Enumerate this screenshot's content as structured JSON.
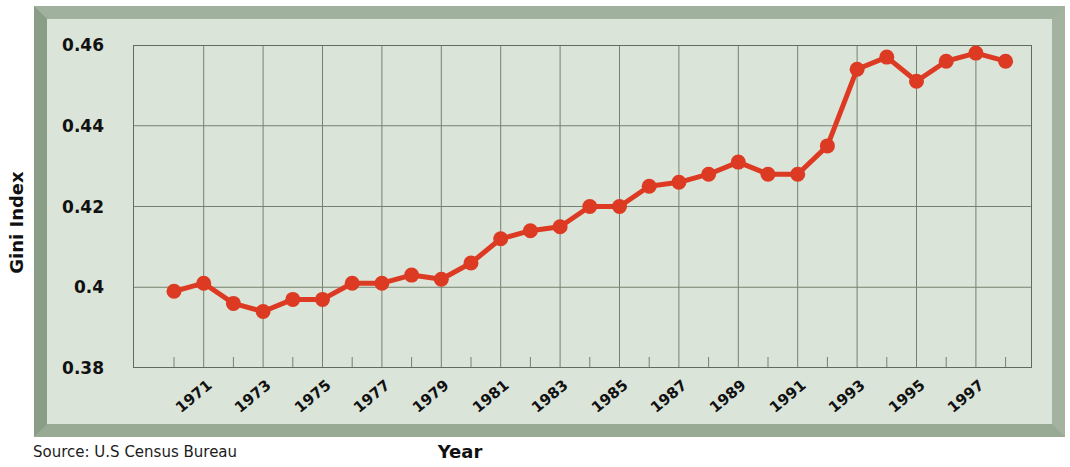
{
  "chart_data": {
    "type": "line",
    "title": "",
    "xlabel": "Year",
    "ylabel": "Gini Index",
    "source": "Source: U.S Census Bureau",
    "series_name": "Gini Index",
    "years": [
      1970,
      1971,
      1972,
      1973,
      1974,
      1975,
      1976,
      1977,
      1978,
      1979,
      1980,
      1981,
      1982,
      1983,
      1984,
      1985,
      1986,
      1987,
      1988,
      1989,
      1990,
      1991,
      1992,
      1993,
      1994,
      1995,
      1996,
      1997,
      1998
    ],
    "values": [
      0.399,
      0.401,
      0.396,
      0.394,
      0.397,
      0.397,
      0.401,
      0.401,
      0.403,
      0.402,
      0.406,
      0.412,
      0.414,
      0.415,
      0.42,
      0.42,
      0.425,
      0.426,
      0.428,
      0.431,
      0.428,
      0.428,
      0.435,
      0.454,
      0.457,
      0.451,
      0.456,
      0.458,
      0.456
    ],
    "x_tick_labels": [
      "1971",
      "1973",
      "1975",
      "1977",
      "1979",
      "1981",
      "1983",
      "1985",
      "1987",
      "1989",
      "1991",
      "1993",
      "1995",
      "1997"
    ],
    "x_gridline_years": [
      1971,
      1973,
      1975,
      1977,
      1979,
      1981,
      1983,
      1985,
      1987,
      1989,
      1991,
      1993,
      1995,
      1997
    ],
    "x_minor_tick_years": [
      1970,
      1972,
      1974,
      1976,
      1978,
      1980,
      1982,
      1984,
      1986,
      1988,
      1990,
      1992,
      1994,
      1996,
      1998
    ],
    "y_tick_labels": [
      "0.46",
      "0.44",
      "0.42",
      "0.4",
      "0.38"
    ],
    "y_tick_values": [
      0.46,
      0.44,
      0.42,
      0.4,
      0.38
    ],
    "ylim": [
      0.38,
      0.46
    ],
    "grid": "on",
    "legend": "none",
    "colors": {
      "line": "#dc3a23",
      "marker": "#dc3a23",
      "grid": "#75826f",
      "plot_border": "#5f6e5c",
      "panel_bg": "#dbe4d8",
      "text": "#111111"
    }
  }
}
